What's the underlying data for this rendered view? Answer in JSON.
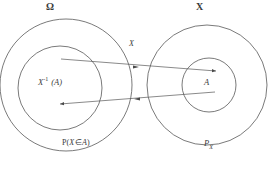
{
  "figure": {
    "background_color": "#ffffff",
    "stroke_color": "#4a4a4a",
    "text_color": "#3a3a3a"
  },
  "labels": {
    "domain_set": "Ω",
    "codomain_set": "X",
    "map_name": "X",
    "preimage_base": "X",
    "preimage_exponent": "-1",
    "preimage_argument": "(A)",
    "event_set": "A",
    "probability_p": "P",
    "probability_open": "(",
    "probability_variable": "X",
    "probability_member": "∈",
    "probability_set": "A",
    "probability_close": ")",
    "pushforward_base": "P",
    "pushforward_subscript": "X"
  },
  "shapes": {
    "omega_circle": {
      "cx": 66,
      "cy": 85,
      "r": 66,
      "name": "omega-outer-circle"
    },
    "preimage_circle": {
      "cx": 60,
      "cy": 88,
      "r": 42,
      "name": "preimage-inner-circle"
    },
    "codomain_circle": {
      "cx": 207,
      "cy": 85,
      "r": 60,
      "name": "codomain-outer-circle"
    },
    "event_circle": {
      "cx": 209,
      "cy": 85,
      "r": 27,
      "name": "event-inner-circle"
    }
  },
  "arrows": [
    {
      "name": "forward-map-arrow",
      "direction": "left-to-right",
      "from": [
        62,
        59
      ],
      "to": [
        207,
        70
      ],
      "label": "X"
    },
    {
      "name": "pullback-arrow",
      "direction": "right-to-left",
      "from": [
        209,
        95
      ],
      "to": [
        62,
        104
      ],
      "label": "P_X"
    }
  ]
}
